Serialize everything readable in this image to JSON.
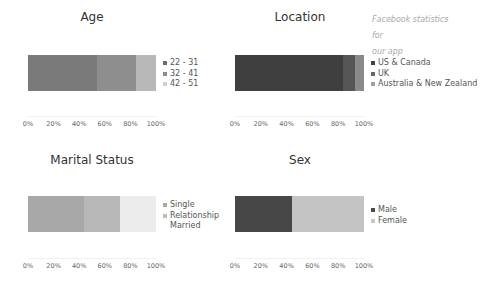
{
  "annotation": {
    "line1": "Facebook statistics for",
    "line2": "our app"
  },
  "axis_ticks": [
    "0%",
    "20%",
    "40%",
    "60%",
    "80%",
    "100%"
  ],
  "chart_data": [
    {
      "type": "bar",
      "orientation": "horizontal-stacked",
      "title": "Age",
      "categories": [
        "22 - 31",
        "32 - 41",
        "42 - 51"
      ],
      "values": [
        54,
        30,
        16
      ],
      "colors": [
        "#7a7a7a",
        "#8e8e8e",
        "#b8b8b8"
      ],
      "xlim": [
        0,
        100
      ],
      "xticks": [
        "0%",
        "20%",
        "40%",
        "60%",
        "80%",
        "100%"
      ],
      "legend_position": "right",
      "grid": false
    },
    {
      "type": "bar",
      "orientation": "horizontal-stacked",
      "title": "Location",
      "categories": [
        "US & Canada",
        "UK",
        "Australia & New Zealand"
      ],
      "values": [
        84,
        9,
        7
      ],
      "colors": [
        "#3f3f3f",
        "#555555",
        "#8a8a8a"
      ],
      "xlim": [
        0,
        100
      ],
      "xticks": [
        "0%",
        "20%",
        "40%",
        "60%",
        "80%",
        "100%"
      ],
      "legend_position": "right",
      "grid": false
    },
    {
      "type": "bar",
      "orientation": "horizontal-stacked",
      "title": "Marital Status",
      "categories": [
        "Single",
        "Relationship",
        "Married"
      ],
      "values": [
        44,
        28,
        28
      ],
      "colors": [
        "#a8a8a8",
        "#b8b8b8",
        "#ececec"
      ],
      "xlim": [
        0,
        100
      ],
      "xticks": [
        "0%",
        "20%",
        "40%",
        "60%",
        "80%",
        "100%"
      ],
      "legend_position": "right",
      "grid": false
    },
    {
      "type": "bar",
      "orientation": "horizontal-stacked",
      "title": "Sex",
      "categories": [
        "Male",
        "Female"
      ],
      "values": [
        44,
        56
      ],
      "colors": [
        "#474747",
        "#c4c4c4"
      ],
      "xlim": [
        0,
        100
      ],
      "xticks": [
        "0%",
        "20%",
        "40%",
        "60%",
        "80%",
        "100%"
      ],
      "legend_position": "right",
      "grid": false
    }
  ],
  "legend_swatch_colors": {
    "age": [
      "#6d6d6d",
      "#8a8a8a",
      "#cfcfcf"
    ],
    "location": [
      "#444444",
      "#666666",
      "#a0a0a0"
    ],
    "marital": [
      "#a8a8a8",
      "#bdbdbd",
      "transparent"
    ],
    "sex": [
      "#4a4a4a",
      "#c8c8c8"
    ]
  }
}
